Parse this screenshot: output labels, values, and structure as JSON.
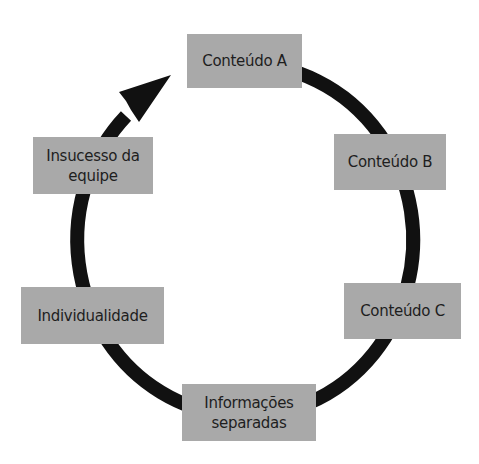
{
  "diagram": {
    "type": "cycle",
    "direction": "clockwise",
    "colors": {
      "node_fill": "#a9a9a9",
      "node_text": "#1e1e1e",
      "arrow": "#111111",
      "background": "#ffffff"
    },
    "nodes": [
      {
        "id": "conteudo-a",
        "label": "Conteúdo A",
        "lines": [
          "Conteúdo A"
        ]
      },
      {
        "id": "conteudo-b",
        "label": "Conteúdo B",
        "lines": [
          "Conteúdo B"
        ]
      },
      {
        "id": "conteudo-c",
        "label": "Conteúdo C",
        "lines": [
          "Conteúdo C"
        ]
      },
      {
        "id": "informacoes-separadas",
        "label": "Informações separadas",
        "lines": [
          "Informações",
          "separadas"
        ]
      },
      {
        "id": "individualidade",
        "label": "Individualidade",
        "lines": [
          "Individualidade"
        ]
      },
      {
        "id": "insucesso-da-equipe",
        "label": "Insucesso da equipe",
        "lines": [
          "Insucesso da",
          "equipe"
        ]
      }
    ],
    "edges": [
      {
        "from": "conteudo-a",
        "to": "conteudo-b"
      },
      {
        "from": "conteudo-b",
        "to": "conteudo-c"
      },
      {
        "from": "conteudo-c",
        "to": "informacoes-separadas"
      },
      {
        "from": "informacoes-separadas",
        "to": "individualidade"
      },
      {
        "from": "individualidade",
        "to": "insucesso-da-equipe"
      },
      {
        "from": "insucesso-da-equipe",
        "to": "conteudo-a",
        "arrowhead": true
      }
    ]
  }
}
